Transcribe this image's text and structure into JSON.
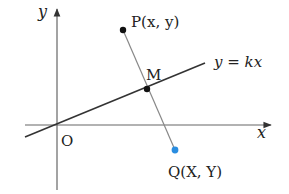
{
  "diagram": {
    "axes": {
      "x_label": "x",
      "y_label": "y",
      "origin_label": "O",
      "color": "#555555"
    },
    "line": {
      "label": "y = kx",
      "color": "#333333"
    },
    "points": {
      "P": {
        "label": "P(x, y)",
        "color": "#111111"
      },
      "M": {
        "label": "M",
        "color": "#111111"
      },
      "Q": {
        "label": "Q(X, Y)",
        "color": "#2a8de0"
      }
    },
    "segment_PQ_color": "#777777"
  }
}
